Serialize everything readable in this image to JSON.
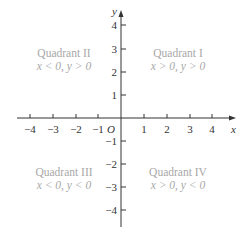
{
  "diagram": {
    "type": "cartesian-coordinate-plane",
    "axes": {
      "x_label": "x",
      "y_label": "y",
      "origin_label": "O",
      "x_ticks": [
        "−4",
        "−3",
        "−2",
        "−1",
        "1",
        "2",
        "3",
        "4"
      ],
      "y_ticks_positive": [
        "4",
        "3",
        "2",
        "1"
      ],
      "y_ticks_negative": [
        "−1",
        "−2",
        "−3",
        "−4"
      ]
    },
    "quadrants": [
      {
        "name": "Quadrant I",
        "condition": "x > 0, y > 0"
      },
      {
        "name": "Quadrant II",
        "condition": "x < 0, y > 0"
      },
      {
        "name": "Quadrant III",
        "condition": "x < 0, y < 0"
      },
      {
        "name": "Quadrant IV",
        "condition": "x > 0, y < 0"
      }
    ],
    "colors": {
      "axis": "#333333",
      "quadrant_text": "#a8a8a8"
    }
  }
}
